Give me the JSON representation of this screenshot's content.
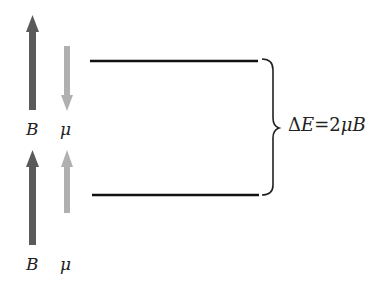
{
  "diagram": {
    "type": "energy-level-diagram",
    "upper_state": {
      "field_label": "B",
      "moment_label": "μ",
      "field_direction": "up",
      "moment_direction": "down"
    },
    "lower_state": {
      "field_label": "B",
      "moment_label": "μ",
      "field_direction": "up",
      "moment_direction": "up"
    },
    "energy_gap": {
      "delta": "Δ",
      "E": "E",
      "equals": "=",
      "coef": "2",
      "mu": "μ",
      "B": "B",
      "full": "ΔE = 2μB"
    }
  },
  "colors": {
    "field_arrow": "#5a5a5a",
    "moment_arrow": "#b0b0b0",
    "level_line": "#111111",
    "brace": "#222222"
  }
}
